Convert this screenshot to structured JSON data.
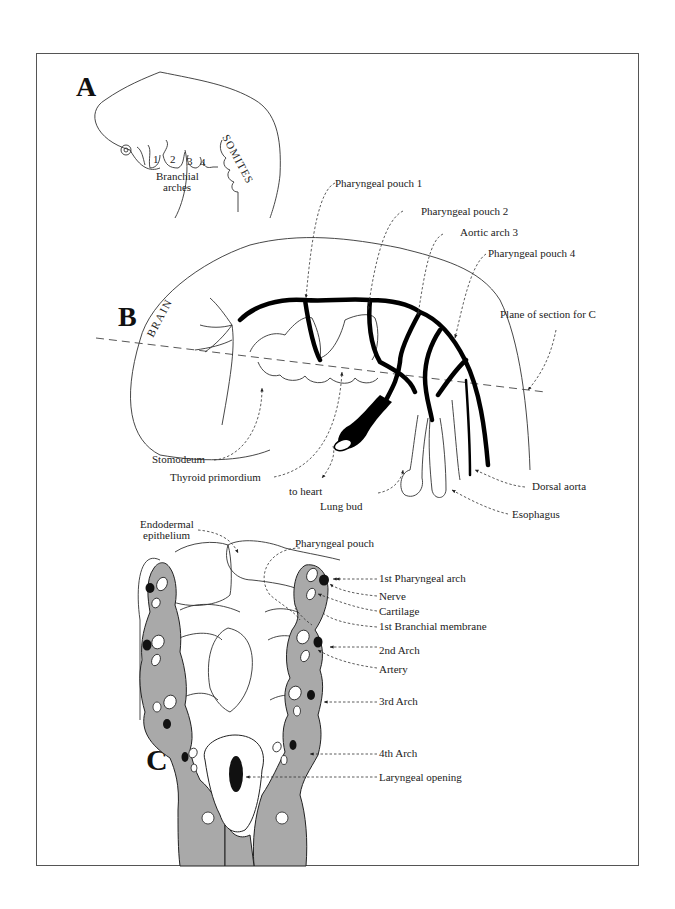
{
  "figure": {
    "panels": {
      "a": {
        "letter": "A",
        "arch_numbers": [
          "1",
          "2",
          "3",
          "4"
        ],
        "arch_label_line1": "Branchial",
        "arch_label_line2": "arches",
        "somites_label": "SOMITES"
      },
      "b": {
        "letter": "B",
        "brain_label": "BRAIN",
        "labels": {
          "pharyngeal_pouch_1": "Pharyngeal pouch 1",
          "pharyngeal_pouch_2": "Pharyngeal pouch 2",
          "aortic_arch_3": "Aortic arch 3",
          "pharyngeal_pouch_4": "Pharyngeal pouch 4",
          "plane_of_section": "Plane of section for C",
          "stomodeum": "Stomodeum",
          "thyroid_primordium": "Thyroid primordium",
          "to_heart": "to heart",
          "lung_bud": "Lung bud",
          "dorsal_aorta": "Dorsal aorta",
          "esophagus": "Esophagus"
        }
      },
      "c": {
        "letter": "C",
        "labels": {
          "endodermal_epithelium_line1": "Endodermal",
          "endodermal_epithelium_line2": "epithelium",
          "pharyngeal_pouch": "Pharyngeal pouch",
          "first_pharyngeal_arch": "1st Pharyngeal arch",
          "nerve": "Nerve",
          "cartilage": "Cartilage",
          "first_branchial_membrane": "1st Branchial membrane",
          "second_arch": "2nd Arch",
          "artery": "Artery",
          "third_arch": "3rd Arch",
          "fourth_arch": "4th Arch",
          "laryngeal_opening": "Laryngeal opening"
        }
      }
    },
    "colors": {
      "arch_fill": "#a9a9a9",
      "line": "#333333",
      "frame": "#555555"
    }
  }
}
